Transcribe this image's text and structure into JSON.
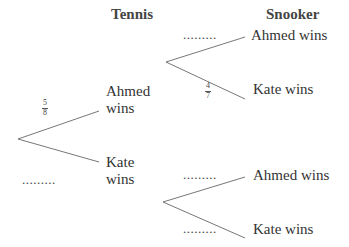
{
  "headings": {
    "stage1": "Tennis",
    "stage2": "Snooker"
  },
  "tree": {
    "root": {
      "branches": [
        {
          "outcome": "Ahmed wins",
          "outcome_line1": "Ahmed",
          "outcome_line2": "wins",
          "probability_num": "5",
          "probability_den": "8",
          "probability": "5/8"
        },
        {
          "outcome": "Kate wins",
          "outcome_line1": "Kate",
          "outcome_line2": "wins",
          "probability": "........."
        }
      ]
    },
    "after_ahmed": {
      "branches": [
        {
          "outcome": "Ahmed wins",
          "probability": "........."
        },
        {
          "outcome": "Kate wins",
          "probability_num": "4",
          "probability_den": "7",
          "probability": "4/7"
        }
      ]
    },
    "after_kate": {
      "branches": [
        {
          "outcome": "Ahmed wins",
          "probability": "........."
        },
        {
          "outcome": "Kate wins",
          "probability": "........."
        }
      ]
    }
  },
  "colors": {
    "line": "#777777",
    "text": "#333333"
  }
}
